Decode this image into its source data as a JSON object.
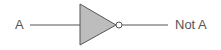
{
  "diagram": {
    "type": "logic-gate",
    "gate": "NOT",
    "input_label": "A",
    "output_label": "Not A",
    "colors": {
      "gate_fill": "#bdbdbd",
      "stroke": "#555555",
      "text": "#555555"
    }
  }
}
